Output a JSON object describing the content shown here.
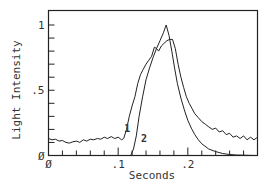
{
  "chart_data": {
    "type": "line",
    "title": "",
    "xlabel": "Seconds",
    "ylabel": "Light Intensity",
    "xlim": [
      0,
      0.3
    ],
    "ylim": [
      0,
      1.0
    ],
    "x_tick_labels": [
      {
        "value": 0,
        "label": "Ø"
      },
      {
        "value": 0.1,
        "label": ".1"
      },
      {
        "value": 0.2,
        "label": ".2"
      }
    ],
    "y_tick_labels": [
      {
        "value": 0,
        "label": "Ø"
      },
      {
        "value": 0.5,
        "label": ".5"
      },
      {
        "value": 1.0,
        "label": "1"
      }
    ],
    "x_minor_tick_step": 0.02,
    "y_minor_tick_step": 0.1,
    "grid": false,
    "legend": "none",
    "annotations": [
      {
        "text": "1",
        "x": 0.113,
        "y": 0.18,
        "series": "1"
      },
      {
        "text": "2",
        "x": 0.137,
        "y": 0.1,
        "series": "2"
      }
    ],
    "series": [
      {
        "name": "1",
        "style": "noisy",
        "x": [
          0,
          0.005,
          0.01,
          0.015,
          0.02,
          0.025,
          0.03,
          0.035,
          0.04,
          0.045,
          0.05,
          0.055,
          0.06,
          0.065,
          0.07,
          0.075,
          0.08,
          0.085,
          0.09,
          0.095,
          0.1,
          0.105,
          0.108,
          0.112,
          0.116,
          0.12,
          0.124,
          0.128,
          0.132,
          0.136,
          0.14,
          0.144,
          0.148,
          0.152,
          0.155,
          0.158,
          0.162,
          0.166,
          0.17,
          0.174,
          0.178,
          0.182,
          0.186,
          0.19,
          0.194,
          0.198,
          0.202,
          0.206,
          0.21,
          0.215,
          0.22,
          0.225,
          0.23,
          0.235,
          0.24,
          0.245,
          0.25,
          0.255,
          0.26,
          0.265,
          0.27,
          0.275,
          0.28,
          0.285,
          0.29,
          0.295,
          0.3
        ],
        "y": [
          0.13,
          0.12,
          0.125,
          0.11,
          0.115,
          0.1,
          0.095,
          0.105,
          0.11,
          0.1,
          0.12,
          0.11,
          0.125,
          0.12,
          0.13,
          0.125,
          0.14,
          0.13,
          0.145,
          0.13,
          0.14,
          0.12,
          0.13,
          0.2,
          0.3,
          0.38,
          0.45,
          0.55,
          0.62,
          0.66,
          0.7,
          0.73,
          0.76,
          0.83,
          0.82,
          0.8,
          0.84,
          0.86,
          0.88,
          0.89,
          0.89,
          0.82,
          0.7,
          0.6,
          0.52,
          0.45,
          0.4,
          0.36,
          0.32,
          0.29,
          0.26,
          0.24,
          0.22,
          0.2,
          0.21,
          0.18,
          0.19,
          0.16,
          0.17,
          0.14,
          0.15,
          0.13,
          0.15,
          0.12,
          0.14,
          0.12,
          0.14
        ]
      },
      {
        "name": "2",
        "style": "smooth",
        "x": [
          0,
          0.05,
          0.1,
          0.118,
          0.122,
          0.126,
          0.13,
          0.135,
          0.14,
          0.145,
          0.15,
          0.155,
          0.16,
          0.165,
          0.169,
          0.173,
          0.177,
          0.181,
          0.185,
          0.19,
          0.195,
          0.2,
          0.205,
          0.21,
          0.215,
          0.22,
          0.23,
          0.24,
          0.25,
          0.26,
          0.27,
          0.28,
          0.29,
          0.3
        ],
        "y": [
          0,
          0,
          0,
          0,
          0.05,
          0.15,
          0.3,
          0.45,
          0.58,
          0.67,
          0.75,
          0.82,
          0.88,
          0.94,
          1.0,
          0.92,
          0.8,
          0.67,
          0.55,
          0.44,
          0.35,
          0.27,
          0.21,
          0.16,
          0.12,
          0.09,
          0.05,
          0.03,
          0.015,
          0.008,
          0.004,
          0.002,
          0.001,
          0.0
        ]
      }
    ]
  }
}
